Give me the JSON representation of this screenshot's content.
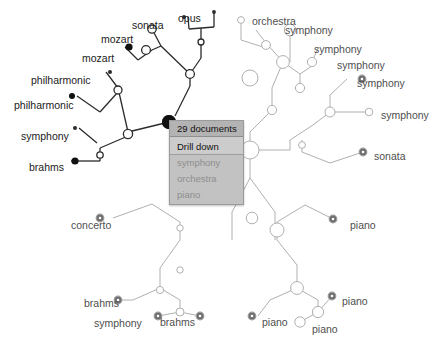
{
  "view": {
    "title": "Document hierarchy drill-down",
    "background": "#ffffff",
    "accent_selected": "#111111",
    "accent_dim": "#9a9a9a"
  },
  "context_menu": {
    "header": "29 documents",
    "action": "Drill down",
    "options": [
      "symphony",
      "orchestra",
      "piano"
    ],
    "header_bg": "#b3b3b3",
    "action_bg": "#cccccc",
    "option_bg": "#c2c2c2",
    "option_text_color": "#8e8e8e"
  },
  "labels": {
    "top_cluster": [
      {
        "id": "sonata-top",
        "text": "sonata",
        "x": 132,
        "y": 20,
        "dim": false
      },
      {
        "id": "opus-top",
        "text": "opus",
        "x": 178,
        "y": 13,
        "dim": false
      },
      {
        "id": "mozart-1",
        "text": "mozart",
        "x": 101,
        "y": 34,
        "dim": false
      },
      {
        "id": "mozart-2",
        "text": "mozart",
        "x": 82,
        "y": 53,
        "dim": false
      },
      {
        "id": "philharmonic-1",
        "text": "philharmonic",
        "x": 31,
        "y": 75,
        "dim": false
      },
      {
        "id": "philharmonic-2",
        "text": "philharmonic",
        "x": 14,
        "y": 100,
        "dim": false
      },
      {
        "id": "symphony-left",
        "text": "symphony",
        "x": 21,
        "y": 131,
        "dim": false
      },
      {
        "id": "brahms-left",
        "text": "brahms",
        "x": 29,
        "y": 162,
        "dim": false
      }
    ],
    "right_cluster": [
      {
        "id": "orchestra-r",
        "text": "orchestra",
        "x": 252,
        "y": 16,
        "dim": true
      },
      {
        "id": "symphony-r1",
        "text": "symphony",
        "x": 285,
        "y": 25,
        "dim": true
      },
      {
        "id": "symphony-r2",
        "text": "symphony",
        "x": 314,
        "y": 44,
        "dim": true
      },
      {
        "id": "symphony-r3",
        "text": "symphony",
        "x": 337,
        "y": 60,
        "dim": true
      },
      {
        "id": "symphony-r4",
        "text": "symphony",
        "x": 357,
        "y": 78,
        "dim": true
      },
      {
        "id": "symphony-r5",
        "text": "symphony",
        "x": 381,
        "y": 110,
        "dim": true
      },
      {
        "id": "sonata-r",
        "text": "sonata",
        "x": 374,
        "y": 151,
        "dim": true
      }
    ],
    "bottom_left_cluster": [
      {
        "id": "concerto-b",
        "text": "concerto",
        "x": 71,
        "y": 220,
        "dim": true
      },
      {
        "id": "brahms-b1",
        "text": "brahms",
        "x": 84,
        "y": 298,
        "dim": true
      },
      {
        "id": "symphony-b",
        "text": "symphony",
        "x": 94,
        "y": 318,
        "dim": true
      },
      {
        "id": "brahms-b2",
        "text": "brahms",
        "x": 160,
        "y": 317,
        "dim": true
      }
    ],
    "bottom_right_cluster": [
      {
        "id": "piano-r1",
        "text": "piano",
        "x": 350,
        "y": 220,
        "dim": true
      },
      {
        "id": "piano-r2",
        "text": "piano",
        "x": 342,
        "y": 296,
        "dim": true
      },
      {
        "id": "piano-r3",
        "text": "piano",
        "x": 262,
        "y": 317,
        "dim": true
      },
      {
        "id": "piano-r4",
        "text": "piano",
        "x": 312,
        "y": 324,
        "dim": true
      }
    ]
  },
  "graph_data": {
    "type": "tree",
    "description": "Radial dendrogram of music documents with a selected hub node showing a drill-down context menu.",
    "selected_node": {
      "id": "hub-selected",
      "x": 169,
      "y": 122,
      "r": 7,
      "fill": "#111111",
      "documents": 29
    },
    "edges_active": [
      [
        188,
        17,
        189,
        29
      ],
      [
        214,
        12,
        214,
        27
      ],
      [
        189,
        29,
        214,
        27
      ],
      [
        201,
        28,
        201,
        42
      ],
      [
        152,
        29,
        161,
        46
      ],
      [
        125,
        47,
        138,
        60
      ],
      [
        138,
        60,
        152,
        50
      ],
      [
        152,
        50,
        161,
        46
      ],
      [
        161,
        46,
        190,
        74
      ],
      [
        201,
        42,
        201,
        58
      ],
      [
        190,
        74,
        201,
        58
      ],
      [
        190,
        74,
        190,
        86
      ],
      [
        106,
        72,
        118,
        88
      ],
      [
        77,
        96,
        100,
        112
      ],
      [
        100,
        112,
        118,
        92
      ],
      [
        118,
        92,
        118,
        88
      ],
      [
        118,
        88,
        128,
        132
      ],
      [
        190,
        86,
        175,
        116
      ],
      [
        79,
        128,
        97,
        143
      ],
      [
        71,
        161,
        100,
        161
      ],
      [
        100,
        161,
        100,
        148
      ],
      [
        100,
        148,
        128,
        136
      ],
      [
        128,
        136,
        128,
        132
      ],
      [
        128,
        132,
        169,
        122
      ]
    ],
    "edges_dim": [
      [
        241,
        20,
        241,
        40
      ],
      [
        256,
        30,
        266,
        43
      ],
      [
        241,
        40,
        266,
        48
      ],
      [
        266,
        48,
        266,
        43
      ],
      [
        290,
        30,
        290,
        47
      ],
      [
        266,
        43,
        283,
        62
      ],
      [
        290,
        47,
        290,
        62
      ],
      [
        283,
        62,
        300,
        74
      ],
      [
        318,
        48,
        312,
        62
      ],
      [
        300,
        74,
        312,
        66
      ],
      [
        312,
        66,
        312,
        62
      ],
      [
        300,
        74,
        300,
        88
      ],
      [
        283,
        62,
        272,
        88
      ],
      [
        272,
        88,
        272,
        110
      ],
      [
        272,
        110,
        250,
        132
      ],
      [
        250,
        132,
        250,
        150
      ],
      [
        347,
        79,
        330,
        95
      ],
      [
        330,
        95,
        330,
        112
      ],
      [
        330,
        112,
        313,
        125
      ],
      [
        369,
        112,
        345,
        112
      ],
      [
        345,
        112,
        330,
        112
      ],
      [
        313,
        125,
        290,
        140
      ],
      [
        290,
        140,
        290,
        150
      ],
      [
        363,
        152,
        330,
        163
      ],
      [
        330,
        163,
        302,
        152
      ],
      [
        302,
        152,
        302,
        140
      ],
      [
        290,
        150,
        250,
        150
      ],
      [
        250,
        150,
        250,
        178
      ],
      [
        250,
        178,
        232,
        212
      ],
      [
        232,
        212,
        232,
        240
      ],
      [
        250,
        178,
        275,
        212
      ],
      [
        275,
        212,
        275,
        240
      ],
      [
        113,
        218,
        152,
        204
      ],
      [
        152,
        204,
        180,
        222
      ],
      [
        180,
        222,
        180,
        240
      ],
      [
        180,
        240,
        160,
        268
      ],
      [
        160,
        268,
        160,
        288
      ],
      [
        160,
        288,
        133,
        300
      ],
      [
        133,
        300,
        118,
        300
      ],
      [
        160,
        288,
        180,
        300
      ],
      [
        180,
        300,
        180,
        312
      ],
      [
        180,
        312,
        158,
        316
      ],
      [
        180,
        312,
        200,
        316
      ],
      [
        333,
        219,
        305,
        205
      ],
      [
        305,
        205,
        277,
        222
      ],
      [
        277,
        222,
        277,
        240
      ],
      [
        277,
        240,
        297,
        265
      ],
      [
        297,
        265,
        297,
        288
      ],
      [
        297,
        288,
        270,
        300
      ],
      [
        270,
        300,
        258,
        316
      ],
      [
        297,
        288,
        318,
        300
      ],
      [
        318,
        300,
        318,
        312
      ],
      [
        318,
        312,
        300,
        322
      ],
      [
        318,
        312,
        332,
        296
      ]
    ],
    "nodes_filled_dark": [
      {
        "x": 129,
        "y": 47,
        "r": 3.6
      },
      {
        "x": 72,
        "y": 96,
        "r": 3.0
      },
      {
        "x": 75,
        "y": 161,
        "r": 3.6
      },
      {
        "x": 169,
        "y": 122,
        "r": 7.0
      }
    ],
    "nodes_small_dark": [
      {
        "x": 184,
        "y": 17,
        "r": 1.9
      },
      {
        "x": 214,
        "y": 12,
        "r": 1.9
      },
      {
        "x": 110,
        "y": 72,
        "r": 2.0
      },
      {
        "x": 75,
        "y": 128,
        "r": 2.0
      }
    ],
    "nodes_open_white": [
      {
        "x": 152,
        "y": 29,
        "r": 4.2
      },
      {
        "x": 146,
        "y": 50,
        "r": 4.4
      },
      {
        "x": 190,
        "y": 74,
        "r": 4.4
      },
      {
        "x": 201,
        "y": 42,
        "r": 3.0
      },
      {
        "x": 118,
        "y": 90,
        "r": 4.0
      },
      {
        "x": 128,
        "y": 134,
        "r": 4.6
      },
      {
        "x": 100,
        "y": 155,
        "r": 3.2
      }
    ],
    "nodes_ringed_dim": [
      {
        "x": 362,
        "y": 79,
        "r": 3.8
      },
      {
        "x": 363,
        "y": 152,
        "r": 3.8
      },
      {
        "x": 100,
        "y": 218,
        "r": 3.8
      },
      {
        "x": 118,
        "y": 300,
        "r": 3.8
      },
      {
        "x": 158,
        "y": 316,
        "r": 3.8
      },
      {
        "x": 200,
        "y": 316,
        "r": 3.8
      },
      {
        "x": 333,
        "y": 219,
        "r": 3.8
      },
      {
        "x": 332,
        "y": 296,
        "r": 3.8
      },
      {
        "x": 252,
        "y": 316,
        "r": 3.8
      }
    ],
    "nodes_open_dim": [
      {
        "x": 241,
        "y": 20,
        "r": 3.4
      },
      {
        "x": 266,
        "y": 45,
        "r": 4.4
      },
      {
        "x": 290,
        "y": 30,
        "r": 5.8
      },
      {
        "x": 283,
        "y": 62,
        "r": 6.4
      },
      {
        "x": 312,
        "y": 62,
        "r": 4.6
      },
      {
        "x": 250,
        "y": 78,
        "r": 8.0
      },
      {
        "x": 250,
        "y": 150,
        "r": 9.0
      },
      {
        "x": 300,
        "y": 88,
        "r": 4.6
      },
      {
        "x": 272,
        "y": 110,
        "r": 4.6
      },
      {
        "x": 330,
        "y": 112,
        "r": 5.0
      },
      {
        "x": 369,
        "y": 112,
        "r": 3.8
      },
      {
        "x": 302,
        "y": 145,
        "r": 3.4
      },
      {
        "x": 180,
        "y": 228,
        "r": 3.2
      },
      {
        "x": 180,
        "y": 270,
        "r": 3.2
      },
      {
        "x": 160,
        "y": 290,
        "r": 3.6
      },
      {
        "x": 180,
        "y": 312,
        "r": 4.0
      },
      {
        "x": 277,
        "y": 230,
        "r": 7.0
      },
      {
        "x": 252,
        "y": 218,
        "r": 5.8
      },
      {
        "x": 297,
        "y": 288,
        "r": 6.4
      },
      {
        "x": 318,
        "y": 312,
        "r": 5.6
      },
      {
        "x": 300,
        "y": 322,
        "r": 5.2
      }
    ]
  }
}
